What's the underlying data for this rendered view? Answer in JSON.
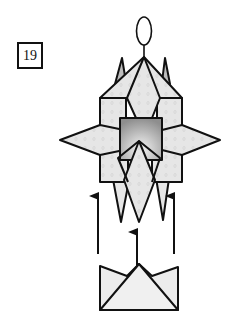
{
  "step": {
    "number": "19"
  },
  "diagram": {
    "colors": {
      "outline": "#111111",
      "paper_light": "#e9e9e9",
      "paper_mid": "#d6d6d6",
      "center_dark": "#9a9a9a",
      "center_light": "#f2f2f2",
      "background": "#ffffff"
    },
    "arrows": [
      {
        "name": "left-arrow",
        "direction": "up"
      },
      {
        "name": "center-arrow",
        "direction": "up"
      },
      {
        "name": "right-arrow",
        "direction": "up"
      }
    ],
    "units": [
      {
        "name": "main-model"
      },
      {
        "name": "boat-unit"
      }
    ]
  }
}
